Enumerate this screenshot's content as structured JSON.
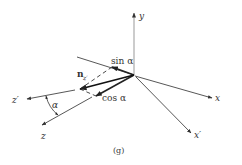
{
  "figure": {
    "caption": "(g)",
    "axes": {
      "y": "y",
      "x": "x",
      "x_prime": "x′",
      "z": "z",
      "z_prime": "z′"
    },
    "labels": {
      "sin": "sin α",
      "cos": "cos α",
      "n_main": "n",
      "n_sub": "z′",
      "alpha": "α"
    },
    "colors": {
      "line": "#333333",
      "axis_light": "#888888"
    }
  }
}
